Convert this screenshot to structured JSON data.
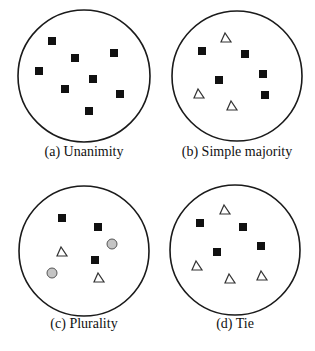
{
  "panels": [
    {
      "id": "a",
      "caption": "(a) Unanimity",
      "circle": {
        "cx": 84,
        "cy": 76,
        "r": 66
      },
      "caption_pos": {
        "x": 84,
        "y": 144
      },
      "squares": [
        [
          52,
          41
        ],
        [
          75,
          58
        ],
        [
          114,
          53
        ],
        [
          39,
          71
        ],
        [
          93,
          79
        ],
        [
          65,
          89
        ],
        [
          120,
          94
        ],
        [
          89,
          111
        ]
      ],
      "triangles": [],
      "dots": []
    },
    {
      "id": "b",
      "caption": "(b) Simple majority",
      "circle": {
        "cx": 237,
        "cy": 76,
        "r": 65
      },
      "caption_pos": {
        "x": 237,
        "y": 144
      },
      "squares": [
        [
          202,
          51
        ],
        [
          245,
          54
        ],
        [
          263,
          74
        ],
        [
          219,
          80
        ],
        [
          265,
          95
        ]
      ],
      "triangles": [
        [
          226,
          38
        ],
        [
          199,
          94
        ],
        [
          232,
          106
        ]
      ],
      "dots": []
    },
    {
      "id": "c",
      "caption": "(c) Plurality",
      "circle": {
        "cx": 84,
        "cy": 251,
        "r": 65
      },
      "caption_pos": {
        "x": 84,
        "y": 316
      },
      "squares": [
        [
          62,
          218
        ],
        [
          98,
          227
        ],
        [
          95,
          260
        ]
      ],
      "triangles": [
        [
          62,
          252
        ],
        [
          99,
          278
        ]
      ],
      "dots": [
        [
          112,
          244
        ],
        [
          52,
          273
        ]
      ]
    },
    {
      "id": "d",
      "caption": "(d) Tie",
      "circle": {
        "cx": 235,
        "cy": 250,
        "r": 65
      },
      "caption_pos": {
        "x": 235,
        "y": 316
      },
      "squares": [
        [
          200,
          223
        ],
        [
          243,
          227
        ],
        [
          261,
          246
        ],
        [
          217,
          252
        ]
      ],
      "triangles": [
        [
          225,
          210
        ],
        [
          197,
          266
        ],
        [
          230,
          279
        ],
        [
          262,
          276
        ]
      ],
      "dots": []
    }
  ],
  "colors": {
    "circle_stroke": "#1a1a1a",
    "square_fill": "#111111",
    "triangle_stroke": "#333333",
    "dot_fill": "#c4c4c4",
    "dot_stroke": "#555555"
  }
}
